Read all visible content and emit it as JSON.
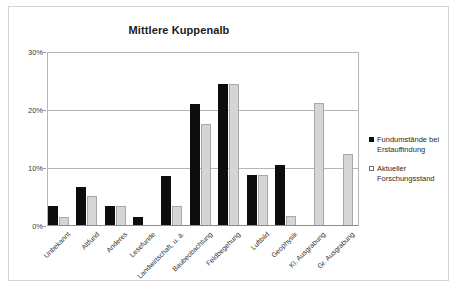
{
  "chart_data": {
    "type": "bar",
    "title": "Mittlere Kuppenalb",
    "xlabel": "",
    "ylabel": "",
    "ylim": [
      0,
      30
    ],
    "ytick_labels": [
      "0%",
      "10%",
      "20%",
      "30%"
    ],
    "ytick_values": [
      0,
      10,
      20,
      30
    ],
    "grid": true,
    "legend_position": "right",
    "categories": [
      "Unbekannt",
      "Altfund",
      "Anderes",
      "Lesefunde",
      "Landwirtschaft, u. ä.",
      "Baubeobachtung",
      "Feldbegehung",
      "Luftbild",
      "Geophysik",
      "Kl. Ausgrabung",
      "Gr. Ausgrabung"
    ],
    "series": [
      {
        "name": "Fundumstände bei Erstauffindung",
        "color": "#0d0d0d",
        "values": [
          3.4,
          6.8,
          3.4,
          1.6,
          8.7,
          21.0,
          24.5,
          8.8,
          10.6,
          0,
          0
        ]
      },
      {
        "name": "Aktueller Forschungsstand",
        "color": "#d5d5d5",
        "values": [
          1.6,
          5.2,
          3.5,
          0,
          3.5,
          17.6,
          24.5,
          8.8,
          1.7,
          21.2,
          12.4
        ]
      }
    ]
  },
  "legend": {
    "items": [
      {
        "label_line1": "Fundumstände bei",
        "label_line2": "Erstauffindung",
        "swatch": "filled"
      },
      {
        "label_line1": "Aktueller",
        "label_line2": "Forschungsstand",
        "swatch": "hollow"
      }
    ]
  }
}
